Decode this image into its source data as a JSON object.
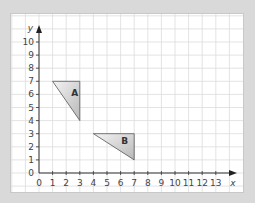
{
  "diagram": {
    "type": "coordinate-grid",
    "axes": {
      "x_label": "x",
      "y_label": "y",
      "x_ticks": [
        "0",
        "1",
        "2",
        "3",
        "4",
        "5",
        "6",
        "7",
        "8",
        "9",
        "10",
        "11",
        "12",
        "13"
      ],
      "y_ticks": [
        "0",
        "1",
        "2",
        "3",
        "4",
        "5",
        "6",
        "7",
        "8",
        "9",
        "10"
      ],
      "x_range": [
        0,
        13
      ],
      "y_range": [
        0,
        10
      ]
    },
    "shapes": [
      {
        "label": "A",
        "vertices": [
          [
            1,
            7
          ],
          [
            3,
            7
          ],
          [
            3,
            4
          ]
        ]
      },
      {
        "label": "B",
        "vertices": [
          [
            4,
            3
          ],
          [
            7,
            3
          ],
          [
            7,
            1
          ]
        ]
      }
    ],
    "colors": {
      "background": "#d9d9d9",
      "frame": "#ffffff",
      "grid": "#dcdcdc",
      "axis": "#333333",
      "shape_fill_light": "#f2f2f2",
      "shape_fill_dark": "#bdbdbd",
      "shape_stroke": "#555555"
    }
  }
}
